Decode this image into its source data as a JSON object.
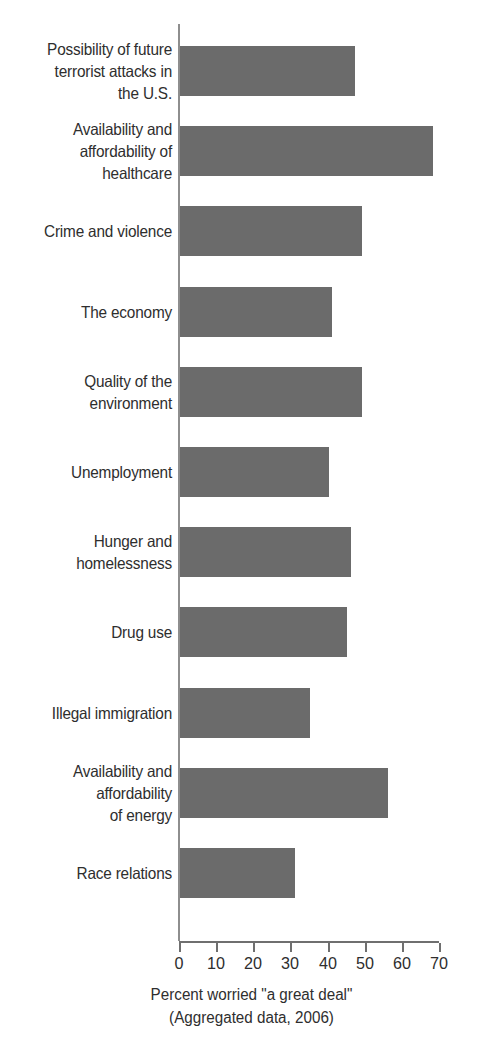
{
  "chart_data": {
    "type": "bar",
    "orientation": "horizontal",
    "title": "",
    "subtitle": "",
    "xlabel": "Percent worried \"a great deal\"",
    "xlabel_sub": "(Aggregated data, 2006)",
    "ylabel": "",
    "xlim": [
      0,
      70
    ],
    "xticks": [
      0,
      10,
      20,
      30,
      40,
      50,
      60,
      70
    ],
    "xtick_labels": [
      "0",
      "10",
      "20",
      "30",
      "40",
      "50",
      "60",
      "70"
    ],
    "grid": false,
    "legend": false,
    "bar_color": "#6b6b6b",
    "axis_color": "#6f6f6f",
    "text_color": "#2e2e2e",
    "categories": [
      "Possibility of future\nterrorist attacks in\nthe U.S.",
      "Availability and\naffordability of\nhealthcare",
      "Crime and violence",
      "The economy",
      "Quality of the\nenvironment",
      "Unemployment",
      "Hunger and\nhomelessness",
      "Drug use",
      "Illegal immigration",
      "Availability and\naffordability\nof energy",
      "Race relations"
    ],
    "values": [
      47,
      68,
      49,
      41,
      49,
      40,
      46,
      45,
      35,
      56,
      31
    ],
    "points": [
      {
        "category": "Possibility of future terrorist attacks in the U.S.",
        "value": 47
      },
      {
        "category": "Availability and affordability of healthcare",
        "value": 68
      },
      {
        "category": "Crime and violence",
        "value": 49
      },
      {
        "category": "The economy",
        "value": 41
      },
      {
        "category": "Quality of the environment",
        "value": 49
      },
      {
        "category": "Unemployment",
        "value": 40
      },
      {
        "category": "Hunger and homelessness",
        "value": 46
      },
      {
        "category": "Drug use",
        "value": 45
      },
      {
        "category": "Illegal immigration",
        "value": 35
      },
      {
        "category": "Availability and affordability of energy",
        "value": 56
      },
      {
        "category": "Race relations",
        "value": 31
      }
    ]
  }
}
